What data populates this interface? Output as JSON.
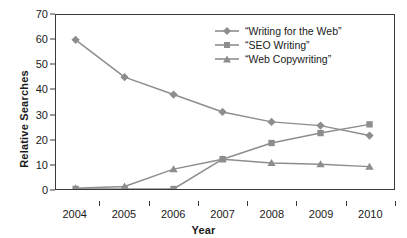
{
  "chart_data": {
    "type": "line",
    "title": "",
    "xlabel": "Year",
    "ylabel": "Relative Searches",
    "categories": [
      "2004",
      "2005",
      "2006",
      "2007",
      "2008",
      "2009",
      "2010"
    ],
    "x": [
      2004,
      2005,
      2006,
      2007,
      2008,
      2009,
      2010
    ],
    "xlim": [
      2003.6,
      2010.5
    ],
    "ylim": [
      0,
      70
    ],
    "yticks": [
      0,
      10,
      20,
      30,
      40,
      50,
      60,
      70
    ],
    "grid": false,
    "legend_position": "top-right",
    "series": [
      {
        "name": "“Writing for the Web”",
        "marker": "diamond",
        "color": "#8d8d8d",
        "values": [
          60,
          45,
          38,
          31,
          27,
          25.5,
          21.5
        ]
      },
      {
        "name": "“SEO Writing”",
        "marker": "square",
        "color": "#8d8d8d",
        "values": [
          0,
          0,
          0,
          12,
          18.5,
          22.5,
          26
        ]
      },
      {
        "name": "“Web Copywriting”",
        "marker": "triangle",
        "color": "#8d8d8d",
        "values": [
          0.3,
          1,
          8,
          12,
          10.5,
          10,
          9
        ]
      }
    ]
  },
  "axes": {
    "y_title": "Relative Searches",
    "x_title": "Year",
    "y_tick_labels": [
      "0",
      "10",
      "20",
      "30",
      "40",
      "50",
      "60",
      "70"
    ],
    "x_tick_labels": [
      "2004",
      "2005",
      "2006",
      "2007",
      "2008",
      "2009",
      "2010"
    ]
  },
  "legend": {
    "items": [
      {
        "label": "“Writing for the Web”",
        "marker": "diamond-marker"
      },
      {
        "label": "“SEO Writing”",
        "marker": "square-marker"
      },
      {
        "label": "“Web Copywriting”",
        "marker": "triangle-marker"
      }
    ]
  },
  "colors": {
    "series": "#8d8d8d",
    "axis": "#3a3a3a",
    "text": "#1a1a1a",
    "background": "#ffffff"
  }
}
